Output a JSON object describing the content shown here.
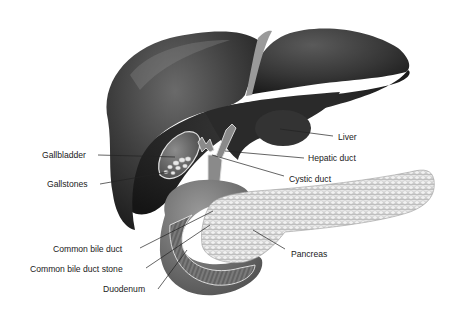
{
  "figure": {
    "style": "grayscale anatomical illustration",
    "colors": {
      "background": "#ffffff",
      "liver_dark": "#2b2b2b",
      "liver_mid": "#4a4a4a",
      "liver_highlight": "#8a8a8a",
      "pancreas": "#d9d9d9",
      "duodenum": "#6e6e6e",
      "label_text": "#1a1a1a",
      "leader_line": "#222222"
    }
  },
  "labels": [
    {
      "id": "liver",
      "text": "Liver"
    },
    {
      "id": "hepatic-duct",
      "text": "Hepatic duct"
    },
    {
      "id": "cystic-duct",
      "text": "Cystic duct"
    },
    {
      "id": "gallbladder",
      "text": "Gallbladder"
    },
    {
      "id": "gallstones",
      "text": "Gallstones"
    },
    {
      "id": "common-bile-duct",
      "text": "Common bile duct"
    },
    {
      "id": "common-bile-duct-stone",
      "text": "Common bile duct stone"
    },
    {
      "id": "duodenum",
      "text": "Duodenum"
    },
    {
      "id": "pancreas",
      "text": "Pancreas"
    }
  ]
}
